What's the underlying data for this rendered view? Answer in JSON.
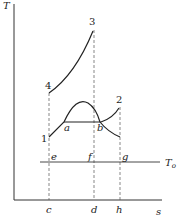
{
  "diagram": {
    "type": "T-s diagram",
    "axes": {
      "y_label": "T",
      "x_label": "s"
    },
    "state_points": [
      "1",
      "2",
      "3",
      "4"
    ],
    "dome_points": [
      "a",
      "b"
    ],
    "t0_line": {
      "label": "T",
      "subscript": "o",
      "points": [
        "e",
        "f",
        "g"
      ]
    },
    "x_axis_points": [
      "c",
      "d",
      "h"
    ]
  }
}
